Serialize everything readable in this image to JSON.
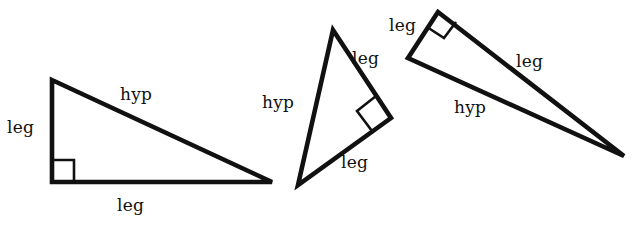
{
  "figure": {
    "background_color": "#ffffff",
    "stroke_color": "#111111",
    "stroke_width": 4,
    "width": 635,
    "height": 226
  },
  "labels": {
    "leg": "leg",
    "hyp": "hyp"
  },
  "triangles": [
    {
      "name": "triangle-1",
      "orientation": "right angle at bottom-left",
      "vertices": [
        {
          "name": "top-left",
          "x": 52,
          "y": 80
        },
        {
          "name": "bottom-left",
          "x": 52,
          "y": 182
        },
        {
          "name": "bottom-right",
          "x": 272,
          "y": 182
        }
      ],
      "right_angle_marker": {
        "x": 52,
        "y": 182,
        "size": 22
      },
      "side_labels": [
        {
          "text": "leg",
          "side": "vertical-left",
          "x": 7,
          "y": 119
        },
        {
          "text": "hyp",
          "side": "hypotenuse",
          "x": 120,
          "y": 86
        },
        {
          "text": "leg",
          "side": "horizontal-bottom",
          "x": 117,
          "y": 197
        }
      ]
    },
    {
      "name": "triangle-2",
      "orientation": "right angle at right vertex, rotated",
      "vertices": [
        {
          "name": "apex-top",
          "x": 333,
          "y": 30
        },
        {
          "name": "right",
          "x": 391,
          "y": 118
        },
        {
          "name": "bottom-left",
          "x": 298,
          "y": 185
        }
      ],
      "right_angle_marker": {
        "x": 391,
        "y": 118,
        "size": 22
      },
      "side_labels": [
        {
          "text": "hyp",
          "side": "left-long",
          "x": 262,
          "y": 94
        },
        {
          "text": "leg",
          "side": "upper-right",
          "x": 352,
          "y": 50
        },
        {
          "text": "leg",
          "side": "lower-right",
          "x": 341,
          "y": 154
        }
      ]
    },
    {
      "name": "triangle-3",
      "orientation": "right angle at top vertex, thin sliver",
      "vertices": [
        {
          "name": "top",
          "x": 438,
          "y": 12
        },
        {
          "name": "left",
          "x": 408,
          "y": 58
        },
        {
          "name": "far-right",
          "x": 624,
          "y": 156
        }
      ],
      "right_angle_marker": {
        "x": 438,
        "y": 12,
        "size": 20
      },
      "side_labels": [
        {
          "text": "leg",
          "side": "short-left",
          "x": 389,
          "y": 17
        },
        {
          "text": "leg",
          "side": "long-upper",
          "x": 516,
          "y": 53
        },
        {
          "text": "hyp",
          "side": "long-lower",
          "x": 454,
          "y": 99
        }
      ]
    }
  ]
}
